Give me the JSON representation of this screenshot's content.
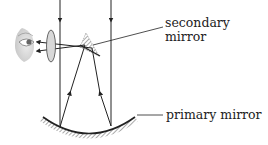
{
  "diagram": {
    "type": "reflecting telescope ray diagram",
    "labels": {
      "secondary_line1": "secondary",
      "secondary_line2": "mirror",
      "primary": "primary mirror"
    },
    "components": [
      "eye",
      "eyepiece-lens",
      "secondary-mirror",
      "primary-mirror",
      "incoming-rays",
      "reflected-rays",
      "output-rays"
    ],
    "colors": {
      "line": "#222222",
      "hatch": "#555555",
      "lens_fill": "#d8d8d8",
      "eye_shade": "#cfcfcf"
    }
  }
}
